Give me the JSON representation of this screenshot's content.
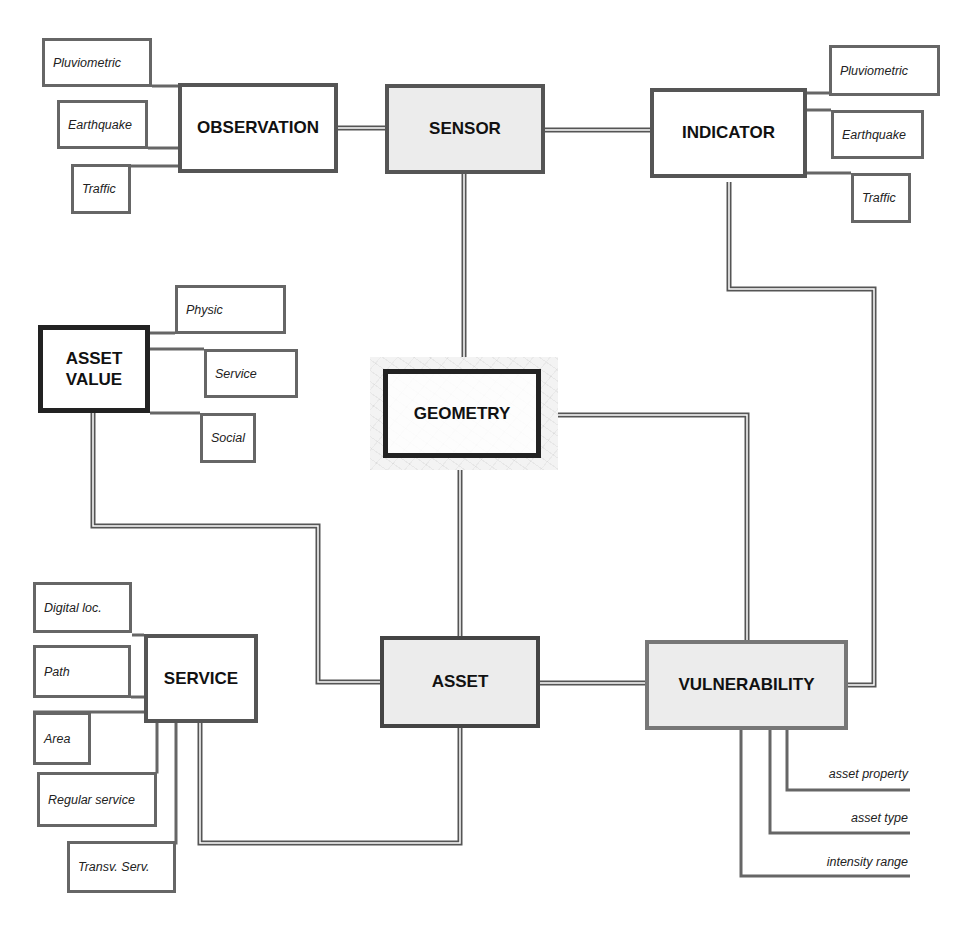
{
  "diagram": {
    "entities": {
      "observation": "OBSERVATION",
      "sensor": "SENSOR",
      "indicator": "INDICATOR",
      "asset_value_line1": "ASSET",
      "asset_value_line2": "VALUE",
      "geometry": "GEOMETRY",
      "service": "SERVICE",
      "asset": "ASSET",
      "vulnerability": "VULNERABILITY"
    },
    "observation_types": [
      "Pluviometric",
      "Earthquake",
      "Traffic"
    ],
    "indicator_types": [
      "Pluviometric",
      "Earthquake",
      "Traffic"
    ],
    "asset_value_types": [
      "Physic",
      "Service",
      "Social"
    ],
    "service_types": [
      "Digital loc.",
      "Path",
      "Area",
      "Regular service",
      "Transv. Serv."
    ],
    "vulnerability_attributes": [
      "asset property",
      "asset type",
      "intensity range"
    ],
    "relations": [
      [
        "OBSERVATION",
        "SENSOR"
      ],
      [
        "SENSOR",
        "INDICATOR"
      ],
      [
        "SENSOR",
        "GEOMETRY"
      ],
      [
        "INDICATOR",
        "VULNERABILITY"
      ],
      [
        "GEOMETRY",
        "ASSET"
      ],
      [
        "GEOMETRY",
        "VULNERABILITY"
      ],
      [
        "ASSET VALUE",
        "ASSET"
      ],
      [
        "SERVICE",
        "ASSET"
      ],
      [
        "ASSET",
        "VULNERABILITY"
      ]
    ],
    "colors": {
      "line": "#555555",
      "shaded_fill": "#ececec",
      "text": "#111111"
    }
  }
}
